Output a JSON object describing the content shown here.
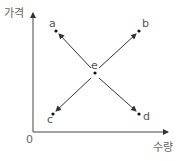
{
  "diagram": {
    "axes": {
      "y_label": "가격",
      "x_label": "수량",
      "origin_label": "0"
    },
    "center_point": {
      "label": "e"
    },
    "points": [
      {
        "label": "a",
        "direction": "up-left"
      },
      {
        "label": "b",
        "direction": "up-right"
      },
      {
        "label": "c",
        "direction": "down-left"
      },
      {
        "label": "d",
        "direction": "down-right"
      }
    ],
    "colors": {
      "line": "#333333",
      "text": "#555555"
    }
  }
}
